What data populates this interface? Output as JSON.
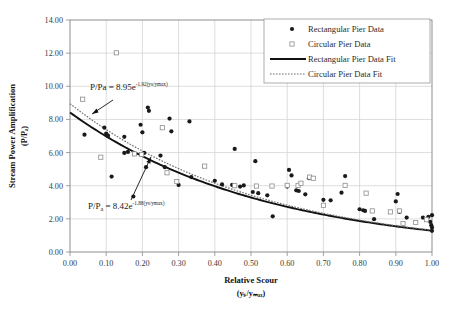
{
  "chart_data": {
    "type": "scatter",
    "title": "",
    "xlabel": "Relative Scour",
    "xlabel_sub": "(ys/ymax)",
    "ylabel": "Stream Power Amplification",
    "ylabel_sub": "(P/Pa)",
    "xlim": [
      0.0,
      1.0
    ],
    "ylim": [
      0.0,
      14.0
    ],
    "xticks": [
      "0.00",
      "0.10",
      "0.20",
      "0.30",
      "0.40",
      "0.50",
      "0.60",
      "0.70",
      "0.80",
      "0.90",
      "1.00"
    ],
    "yticks": [
      "0.00",
      "2.00",
      "4.00",
      "6.00",
      "8.00",
      "10.00",
      "12.00",
      "14.00"
    ],
    "grid": true,
    "legend_position": "top-right",
    "series": [
      {
        "name": "Rectangular Pier Data",
        "marker": "filled-circle",
        "color": "#1a1a1a",
        "points": [
          [
            0.04,
            7.08
          ],
          [
            0.095,
            7.5
          ],
          [
            0.1,
            7.15
          ],
          [
            0.105,
            7.02
          ],
          [
            0.115,
            4.55
          ],
          [
            0.15,
            6.95
          ],
          [
            0.15,
            5.98
          ],
          [
            0.16,
            6.04
          ],
          [
            0.175,
            3.35
          ],
          [
            0.195,
            7.68
          ],
          [
            0.2,
            7.22
          ],
          [
            0.205,
            5.98
          ],
          [
            0.21,
            5.12
          ],
          [
            0.215,
            8.72
          ],
          [
            0.218,
            8.52
          ],
          [
            0.25,
            5.82
          ],
          [
            0.262,
            5.12
          ],
          [
            0.275,
            8.05
          ],
          [
            0.28,
            7.28
          ],
          [
            0.3,
            4.05
          ],
          [
            0.33,
            7.88
          ],
          [
            0.335,
            4.52
          ],
          [
            0.4,
            4.3
          ],
          [
            0.42,
            4.08
          ],
          [
            0.448,
            4.05
          ],
          [
            0.455,
            6.22
          ],
          [
            0.47,
            3.95
          ],
          [
            0.48,
            4.02
          ],
          [
            0.505,
            3.62
          ],
          [
            0.512,
            5.48
          ],
          [
            0.52,
            3.55
          ],
          [
            0.545,
            3.42
          ],
          [
            0.56,
            2.15
          ],
          [
            0.6,
            3.95
          ],
          [
            0.605,
            4.95
          ],
          [
            0.612,
            4.62
          ],
          [
            0.625,
            3.72
          ],
          [
            0.632,
            3.68
          ],
          [
            0.65,
            3.48
          ],
          [
            0.66,
            4.45
          ],
          [
            0.7,
            3.15
          ],
          [
            0.72,
            3.12
          ],
          [
            0.75,
            3.58
          ],
          [
            0.76,
            4.58
          ],
          [
            0.8,
            2.58
          ],
          [
            0.81,
            2.52
          ],
          [
            0.815,
            2.48
          ],
          [
            0.84,
            1.98
          ],
          [
            0.9,
            3.05
          ],
          [
            0.905,
            3.5
          ],
          [
            0.91,
            2.42
          ],
          [
            0.93,
            2.08
          ],
          [
            0.975,
            2.08
          ],
          [
            0.99,
            2.12
          ],
          [
            0.995,
            1.82
          ],
          [
            0.998,
            1.62
          ],
          [
            1.0,
            1.48
          ],
          [
            1.0,
            1.28
          ],
          [
            1.0,
            2.22
          ]
        ]
      },
      {
        "name": "Circular Pier Data",
        "marker": "open-square",
        "color": "#8c8c8c",
        "points": [
          [
            0.035,
            9.22
          ],
          [
            0.085,
            5.72
          ],
          [
            0.128,
            12.02
          ],
          [
            0.178,
            5.92
          ],
          [
            0.198,
            5.88
          ],
          [
            0.255,
            7.5
          ],
          [
            0.268,
            4.78
          ],
          [
            0.295,
            4.25
          ],
          [
            0.372,
            5.18
          ],
          [
            0.455,
            4.0
          ],
          [
            0.515,
            3.98
          ],
          [
            0.558,
            3.98
          ],
          [
            0.6,
            4.02
          ],
          [
            0.63,
            4.02
          ],
          [
            0.638,
            4.15
          ],
          [
            0.662,
            4.52
          ],
          [
            0.672,
            4.45
          ],
          [
            0.7,
            2.82
          ],
          [
            0.76,
            4.02
          ],
          [
            0.818,
            3.55
          ],
          [
            0.835,
            2.48
          ],
          [
            0.885,
            2.42
          ],
          [
            0.91,
            2.48
          ],
          [
            0.92,
            1.72
          ],
          [
            0.955,
            1.78
          ],
          [
            0.985,
            1.95
          ]
        ]
      }
    ],
    "fits": [
      {
        "name": "Rectangular Pier Data Fit",
        "style": "solid",
        "color": "#111111",
        "equation_label": "P/Pa = 8.42e",
        "equation_exponent": "-1.88(ys/ymax)",
        "coefficient": 8.42,
        "rate": -1.88
      },
      {
        "name": "Circular Pier Data Fit",
        "style": "dotted",
        "color": "#6f6f6f",
        "equation_label": "P/Pa = 8.95e",
        "equation_exponent": "-1.92(ys/ymax)",
        "coefficient": 8.95,
        "rate": -1.92
      }
    ],
    "annotations": [
      {
        "id": "eq-circular",
        "text": "P/Pa = 8.95e",
        "exponent": "-1.92(ys/ymax)",
        "x": 0.055,
        "y": 9.35
      },
      {
        "id": "eq-rectangular",
        "text": "P/P",
        "sub": "a",
        "text2": " = 8.42e",
        "exponent": "-1.88(ys/ymax)",
        "x": 0.06,
        "y": 3.05
      }
    ]
  },
  "legend": {
    "items": [
      {
        "label": "Rectangular Pier Data",
        "marker": "filled-circle"
      },
      {
        "label": "Circular Pier Data",
        "marker": "open-square"
      },
      {
        "label": "Rectangular Pier Data Fit",
        "marker": "solid-line"
      },
      {
        "label": "Circular Pier Data Fit",
        "marker": "dotted-line"
      }
    ]
  },
  "axes": {
    "x_title": "Relative Scour",
    "x_subtitle": "(yₛ/yₘₐₓ)",
    "y_title": "Stream Power Amplification",
    "y_subtitle": "(P/Pₐ)"
  }
}
